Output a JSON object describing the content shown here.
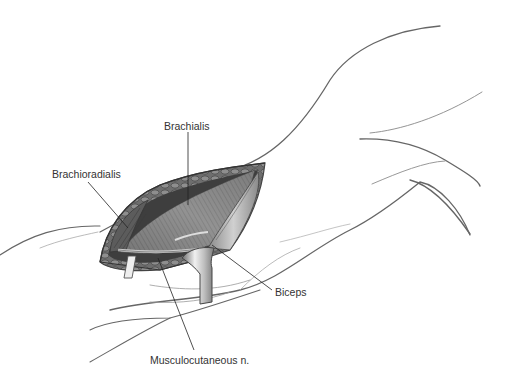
{
  "figure": {
    "labels": [
      {
        "id": "brachialis",
        "text": "Brachialis"
      },
      {
        "id": "brachioradialis",
        "text": "Brachioradialis"
      },
      {
        "id": "biceps",
        "text": "Biceps"
      },
      {
        "id": "musculocutaneous",
        "text": "Musculocutaneous n."
      }
    ]
  },
  "colors": {
    "background": "#ffffff",
    "outline": "#555555",
    "muscle_dark": "#4a4a4a",
    "muscle_mid": "#8a8a8a",
    "muscle_light": "#c8c8c8",
    "label_text": "#333333",
    "leader_line": "#222222"
  }
}
